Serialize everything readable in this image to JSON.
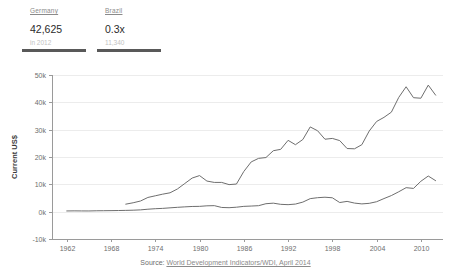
{
  "header": {
    "stats": [
      {
        "name": "Germany",
        "value": "42,625",
        "sub": "in 2012",
        "accent": "#595959"
      },
      {
        "name": "Brazil",
        "value": "0.3x",
        "sub": "11,340",
        "accent": "#595959"
      }
    ]
  },
  "footer": {
    "source_label": "Source:",
    "source_link": "World Development Indicators/WDI, April 2014"
  },
  "chart_data": {
    "type": "line",
    "title": "",
    "xlabel": "",
    "ylabel": "Current US$",
    "xlim": [
      1960,
      2013
    ],
    "ylim": [
      -10000,
      50000
    ],
    "grid": true,
    "legend": "none",
    "y_ticks": [
      -10000,
      0,
      10000,
      20000,
      30000,
      40000,
      50000
    ],
    "y_tick_labels": [
      "-10k",
      "0k",
      "10k",
      "20k",
      "30k",
      "40k",
      "50k"
    ],
    "x_ticks": [
      1962,
      1968,
      1974,
      1980,
      1986,
      1992,
      1998,
      2004,
      2010
    ],
    "x_tick_labels": [
      "1962",
      "1968",
      "1974",
      "1980",
      "1986",
      "1992",
      "1998",
      "2004",
      "2010"
    ],
    "line_color": "#6e6e6e",
    "series": [
      {
        "name": "Germany",
        "x": [
          1970,
          1971,
          1972,
          1973,
          1974,
          1975,
          1976,
          1977,
          1978,
          1979,
          1980,
          1981,
          1982,
          1983,
          1984,
          1985,
          1986,
          1987,
          1988,
          1989,
          1990,
          1991,
          1992,
          1993,
          1994,
          1995,
          1996,
          1997,
          1998,
          1999,
          2000,
          2001,
          2002,
          2003,
          2004,
          2005,
          2006,
          2007,
          2008,
          2009,
          2010,
          2011,
          2012
        ],
        "values": [
          2750,
          3250,
          3900,
          5200,
          5800,
          6400,
          6900,
          8300,
          10300,
          12300,
          13200,
          11200,
          10700,
          10700,
          9900,
          10100,
          14700,
          18200,
          19500,
          19800,
          22300,
          22800,
          26100,
          24500,
          26400,
          31000,
          29600,
          26500,
          26800,
          26000,
          23100,
          23000,
          24500,
          29500,
          33000,
          34500,
          36400,
          41800,
          45700,
          41700,
          41500,
          46300,
          42625
        ]
      },
      {
        "name": "Brazil",
        "x": [
          1962,
          1963,
          1964,
          1965,
          1966,
          1967,
          1968,
          1969,
          1970,
          1971,
          1972,
          1973,
          1974,
          1975,
          1976,
          1977,
          1978,
          1979,
          1980,
          1981,
          1982,
          1983,
          1984,
          1985,
          1986,
          1987,
          1988,
          1989,
          1990,
          1991,
          1992,
          1993,
          1994,
          1995,
          1996,
          1997,
          1998,
          1999,
          2000,
          2001,
          2002,
          2003,
          2004,
          2005,
          2006,
          2007,
          2008,
          2009,
          2010,
          2011,
          2012
        ],
        "values": [
          260,
          290,
          270,
          260,
          320,
          350,
          380,
          420,
          470,
          540,
          660,
          900,
          1080,
          1200,
          1400,
          1590,
          1760,
          1900,
          1940,
          2140,
          2200,
          1540,
          1450,
          1630,
          1940,
          2050,
          2190,
          2910,
          3110,
          2680,
          2560,
          2780,
          3500,
          4770,
          5110,
          5280,
          5080,
          3340,
          3760,
          3140,
          2840,
          3050,
          3640,
          4790,
          5890,
          7280,
          8780,
          8510,
          11120,
          13040,
          11340
        ]
      }
    ]
  }
}
